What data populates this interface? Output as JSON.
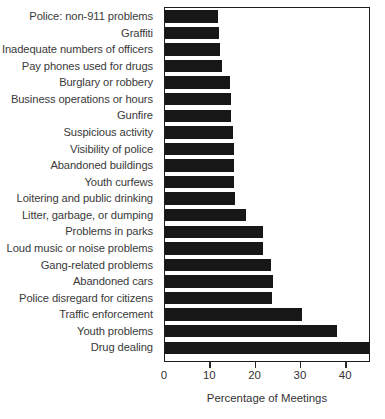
{
  "chart_data": {
    "type": "bar",
    "orientation": "horizontal",
    "title": "",
    "xlabel": "Percentage of Meetings",
    "ylabel": "",
    "xlim": [
      0,
      46
    ],
    "ylim": null,
    "grid": false,
    "legend": null,
    "bar_color": "#171717",
    "xticks": [
      0,
      10,
      20,
      30,
      40
    ],
    "xtick_labels": [
      "0",
      "10",
      "20",
      "30",
      "40"
    ],
    "categories": [
      "Police: non-911 problems",
      "Graffiti",
      "Inadequate numbers of officers",
      "Pay phones used for drugs",
      "Burglary or robbery",
      "Business operations or hours",
      "Gunfire",
      "Suspicious activity",
      "Visibility of police",
      "Abandoned buildings",
      "Youth curfews",
      "Loitering and public drinking",
      "Litter, garbage, or dumping",
      "Problems in parks",
      "Loud music or noise problems",
      "Gang-related problems",
      "Abandoned cars",
      "Police disregard for citizens",
      "Traffic enforcement",
      "Youth problems",
      "Drug dealing"
    ],
    "values": [
      11.7,
      11.9,
      12.1,
      12.6,
      14.3,
      14.6,
      14.6,
      15.0,
      15.2,
      15.2,
      15.2,
      15.4,
      17.9,
      21.6,
      21.6,
      23.4,
      23.8,
      23.6,
      30.2,
      38.0,
      45.5
    ]
  },
  "axis": {
    "x_title": "Percentage of Meetings"
  }
}
